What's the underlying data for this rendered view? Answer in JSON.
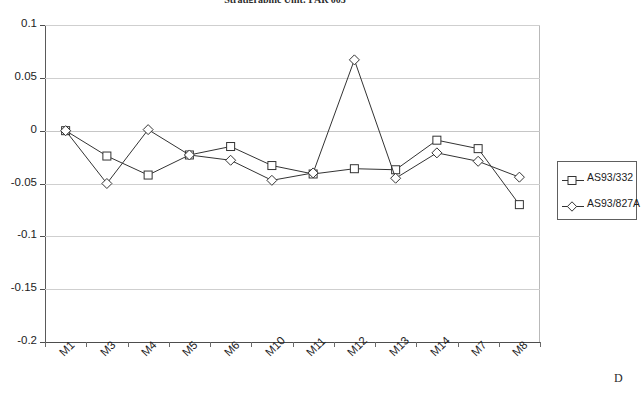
{
  "title": "Stratigraphic Unit: PAR 005",
  "corner_mark": "D",
  "legend": {
    "entries": [
      {
        "label": "AS93/332",
        "marker": "square"
      },
      {
        "label": "AS93/827A",
        "marker": "diamond"
      }
    ]
  },
  "chart_data": {
    "type": "line",
    "title": "Stratigraphic Unit: PAR 005",
    "xlabel": "",
    "ylabel": "",
    "ylim": [
      -0.2,
      0.1
    ],
    "yticks": [
      0.1,
      0.05,
      0,
      -0.05,
      -0.1,
      -0.15,
      -0.2
    ],
    "ytick_labels": [
      "0.1",
      "0.05",
      "0",
      "-0.05",
      "-0.1",
      "-0.15",
      "-0.2"
    ],
    "grid": true,
    "legend_position": "right",
    "categories": [
      "M1",
      "M3",
      "M4",
      "M5",
      "M6",
      "M10",
      "M11",
      "M12",
      "M13",
      "M14",
      "M7",
      "M8"
    ],
    "series": [
      {
        "name": "AS93/332",
        "marker": "square",
        "values": [
          0.0,
          -0.024,
          -0.042,
          -0.023,
          -0.015,
          -0.033,
          -0.041,
          -0.036,
          -0.037,
          -0.009,
          -0.017,
          -0.07
        ]
      },
      {
        "name": "AS93/827A",
        "marker": "diamond",
        "values": [
          0.0,
          -0.05,
          0.001,
          -0.023,
          -0.028,
          -0.047,
          -0.04,
          0.067,
          -0.045,
          -0.021,
          -0.029,
          -0.044
        ]
      }
    ]
  },
  "colors": {
    "line": "#333333",
    "grid": "#cfcfcf",
    "axis": "#4d4d4d",
    "text": "#1c1c1c",
    "background": "#ffffff"
  }
}
